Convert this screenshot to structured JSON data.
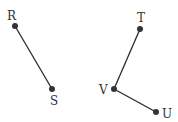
{
  "diagram": {
    "type": "line-segments",
    "colors": {
      "line": "#2a2a2a",
      "point": "#333333",
      "label": "#333333"
    },
    "points": [
      {
        "name": "R",
        "x": 15,
        "y": 26,
        "label_x": 7,
        "label_y": 20
      },
      {
        "name": "S",
        "x": 52,
        "y": 89,
        "label_x": 50,
        "label_y": 105
      },
      {
        "name": "T",
        "x": 140,
        "y": 29,
        "label_x": 137,
        "label_y": 22
      },
      {
        "name": "V",
        "x": 114,
        "y": 89,
        "label_x": 99,
        "label_y": 94
      },
      {
        "name": "U",
        "x": 156,
        "y": 112,
        "label_x": 162,
        "label_y": 118
      }
    ],
    "segments": [
      {
        "name": "RS",
        "from": "R",
        "to": "S"
      },
      {
        "name": "TV",
        "from": "T",
        "to": "V"
      },
      {
        "name": "VU",
        "from": "V",
        "to": "U"
      }
    ]
  }
}
